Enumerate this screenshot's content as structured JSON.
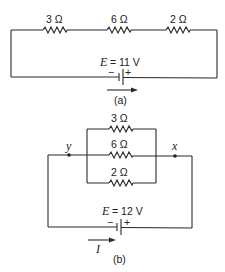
{
  "figure_a": {
    "caption": "(a)",
    "resistors": [
      {
        "label": "3 Ω",
        "x": 50
      },
      {
        "label": "6 Ω",
        "x": 114
      },
      {
        "label": "2 Ω",
        "x": 172
      }
    ],
    "battery": {
      "emf_symbol": "E",
      "emf_value": "= 11 V",
      "minus": "−",
      "plus": "+"
    },
    "current_arrow": "→"
  },
  "figure_b": {
    "caption": "(b)",
    "node_left": "y",
    "node_right": "x",
    "resistors": [
      {
        "label": "3 Ω",
        "branch": "top"
      },
      {
        "label": "6 Ω",
        "branch": "middle"
      },
      {
        "label": "2 Ω",
        "branch": "bottom"
      }
    ],
    "battery": {
      "emf_symbol": "E",
      "emf_value": "= 12 V",
      "minus": "−",
      "plus": "+"
    },
    "current_label": "I"
  }
}
